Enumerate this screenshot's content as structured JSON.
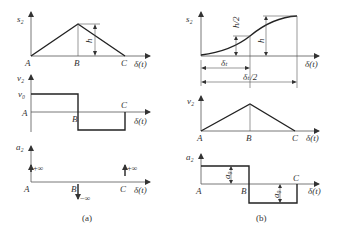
{
  "panel_a": {
    "caption": "(a)",
    "s_plot": {
      "y_label": "s₂",
      "x_label": "δ(t)",
      "points": [
        "A",
        "B",
        "C"
      ],
      "height_label": "h"
    },
    "v_plot": {
      "y_label": "v₂",
      "x_label": "δ(t)",
      "level_label": "v₀",
      "points": [
        "A",
        "B",
        "C"
      ]
    },
    "a_plot": {
      "y_label": "a₂",
      "x_label": "δ(t)",
      "points": [
        "A",
        "B",
        "C"
      ],
      "impulses": [
        "+∞",
        "−∞",
        "+∞"
      ]
    }
  },
  "panel_b": {
    "caption": "(b)",
    "s_plot": {
      "y_label": "s₂",
      "x_label": "δ(t)",
      "half_height_label": "h/2",
      "height_label": "h",
      "dim_inner": "δₜ",
      "dim_outer": "δₜ/2"
    },
    "v_plot": {
      "y_label": "v₂",
      "x_label": "δ(t)",
      "points": [
        "A",
        "B",
        "C"
      ]
    },
    "a_plot": {
      "y_label": "a₂",
      "x_label": "δ(t)",
      "points": [
        "A",
        "B",
        "C"
      ],
      "pos_label": "a₀",
      "neg_label": "a₀"
    }
  }
}
